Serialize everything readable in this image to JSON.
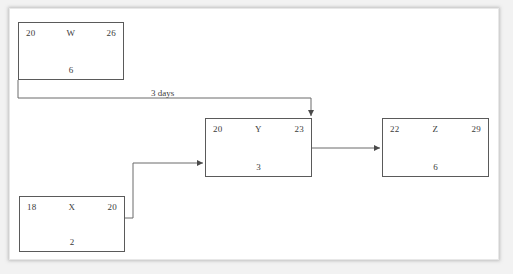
{
  "diagram": {
    "type": "activity-on-node-network",
    "nodes": [
      {
        "id": "W",
        "name": "W",
        "early_start": "20",
        "early_finish": "26",
        "duration": "6",
        "x": 18,
        "y": 22,
        "w": 106,
        "h": 58
      },
      {
        "id": "X",
        "name": "X",
        "early_start": "18",
        "early_finish": "20",
        "duration": "2",
        "x": 19,
        "y": 196,
        "w": 106,
        "h": 56
      },
      {
        "id": "Y",
        "name": "Y",
        "early_start": "20",
        "early_finish": "23",
        "duration": "3",
        "x": 205,
        "y": 118,
        "w": 107,
        "h": 59
      },
      {
        "id": "Z",
        "name": "Z",
        "early_start": "22",
        "early_finish": "29",
        "duration": "6",
        "x": 382,
        "y": 118,
        "w": 107,
        "h": 59
      }
    ],
    "edges": [
      {
        "id": "w-to-y",
        "from": "W",
        "to": "Y",
        "label": "3 days",
        "label_x": 151,
        "label_y": 88
      },
      {
        "id": "x-to-y",
        "from": "X",
        "to": "Y",
        "label": ""
      },
      {
        "id": "y-to-z",
        "from": "Y",
        "to": "Z",
        "label": ""
      }
    ],
    "colors": {
      "page_background": "#ffffff",
      "canvas_background": "#f2f2f2",
      "box_border": "#5a5a5a",
      "connector": "#6b6b6b",
      "text": "#3b3b3b"
    }
  }
}
